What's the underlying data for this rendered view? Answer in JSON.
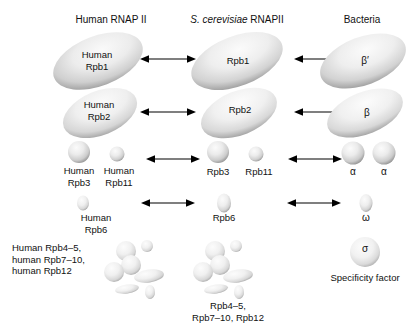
{
  "figure": {
    "type": "diagram",
    "columns": [
      {
        "id": "human",
        "header": "Human RNAP II",
        "header_italic_prefix": ""
      },
      {
        "id": "yeast",
        "header_italic_prefix": "S. cerevisiae",
        "header": " RNAPII"
      },
      {
        "id": "bacteria",
        "header": "Bacteria",
        "header_italic_prefix": ""
      }
    ]
  },
  "headers": {
    "human": "Human RNAP II",
    "yeast_italic": "S. cerevisiae",
    "yeast_rest": " RNAPII",
    "bacteria": "Bacteria"
  },
  "rows": [
    {
      "id": "row-rpb1",
      "human_label": "Human\nRpb1",
      "yeast_label": "Rpb1",
      "bacteria_label": "β′"
    },
    {
      "id": "row-rpb2",
      "human_label": "Human\nRpb2",
      "yeast_label": "Rpb2",
      "bacteria_label": "β"
    },
    {
      "id": "row-rpb3-rpb11",
      "human_label_a": "Human\nRpb3",
      "human_label_b": "Human\nRpb11",
      "yeast_label_a": "Rpb3",
      "yeast_label_b": "Rpb11",
      "bacteria_label_a": "α",
      "bacteria_label_b": "α"
    },
    {
      "id": "row-rpb6",
      "human_label": "Human\nRpb6",
      "yeast_label": "Rpb6",
      "bacteria_label": "ω"
    },
    {
      "id": "row-small-subunits",
      "human_label": "Human Rpb4–5,\nhuman Rpb7–10,\nhuman Rpb12",
      "yeast_label": "Rpb4–5,\nRpb7–10, Rpb12",
      "bacteria_label": "σ",
      "bacteria_caption": "Specificity factor"
    }
  ],
  "arrows": {
    "glyph": "double-headed-arrow",
    "count": 8
  },
  "colors": {
    "shape_light": "#f2f2f2",
    "shape_mid": "#d3d3d3",
    "shape_dark": "#9a9a9a",
    "text": "#111111",
    "arrow": "#000000",
    "background": "#ffffff"
  }
}
